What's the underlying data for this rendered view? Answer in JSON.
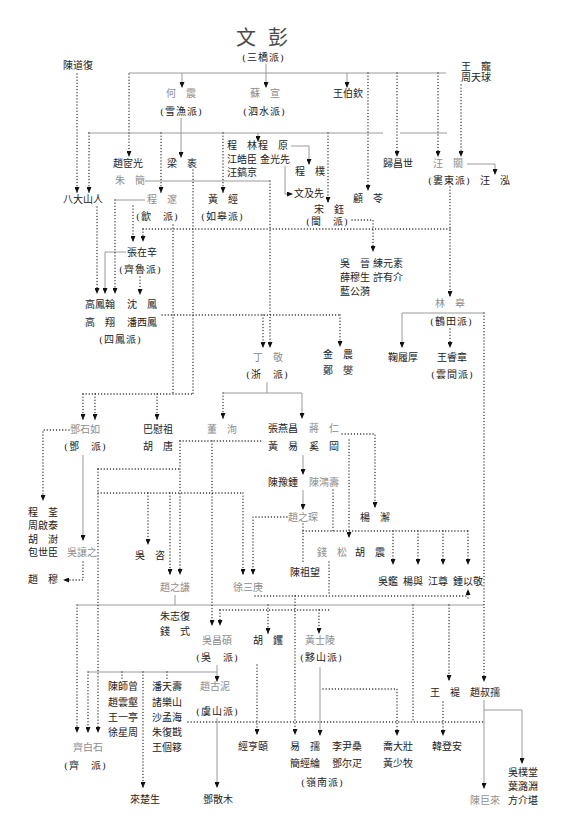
{
  "root": {
    "name": "文 彭",
    "school": "(三橋派)"
  },
  "people": {
    "chen_daofu": "陳道復",
    "wang_chong": "王 寵",
    "zhou_tianqiu": "周天球",
    "he_zhen": "何 震",
    "su_xuan": "蘇 宣",
    "wang_boqin": "王伯欽",
    "zhao_yiguang": "趙宧光",
    "liang_zhi": "梁 袠",
    "cheng_lin": "程 林",
    "cheng_yuan": "程 原",
    "jiang_haochen": "江皓臣",
    "jin_guangxian": "金光先",
    "wang_gaojing": "汪鎬京",
    "cheng_pu": "程 樸",
    "gui_changshi": "歸昌世",
    "wang_guan": "汪 關",
    "wang_hong": "汪 泓",
    "zhu_jian": "朱 簡",
    "badashanren": "八大山人",
    "cheng_sui": "程 邃",
    "huang_jing": "黃 經",
    "wen_jixian": "文及先",
    "gu_ling": "顧 苓",
    "song_jue": "宋 鈺",
    "zhang_zaixin": "張在辛",
    "wu_jin": "吳 晉",
    "lian_yuansu": "練元素",
    "xue_musheng": "薛穆生",
    "xu_youjie": "許有介",
    "lan_gongyi": "藍公漪",
    "lin_gao": "林 皋",
    "gao_fenghan": "高鳳翰",
    "shen_feng": "沈 鳳",
    "gao_xiang": "高 翔",
    "pan_xifeng": "潘西鳳",
    "ding_jing": "丁 敬",
    "jin_nong": "金 農",
    "zheng_xie": "鄭 燮",
    "ju_lvhou": "鞠履厚",
    "wang_ruizhang": "王睿章",
    "deng_shiru": "鄧石如",
    "ba_weizu": "巴慰祖",
    "hu_tang": "胡 唐",
    "dong_xun": "董 洵",
    "zhang_yanchang": "張燕昌",
    "jiang_ren": "蔣 仁",
    "huang_yi": "黃 易",
    "xi_gang": "奚 岡",
    "chen_yuzhong": "陳豫鍾",
    "chen_hongshou": "陳鴻壽",
    "zhao_zhichen": "趙之琛",
    "yang_xie": "楊 澥",
    "cheng_quan": "程 荃",
    "zhou_qitai": "周啟泰",
    "hu_shu": "胡 澍",
    "bao_shichen": "包世臣",
    "wu_rangzhi": "吳讓之",
    "zhao_mu": "趙 穆",
    "wu_zi": "吳 咨",
    "zhao_zhiqian": "趙之謙",
    "xu_sangeng": "徐三庚",
    "qian_song": "錢 松",
    "hu_zhen": "胡 震",
    "chen_zuwang": "陳祖望",
    "wu_jian": "吳鑑",
    "yang_yu": "楊與",
    "jiang_zun": "江尊",
    "zhong_yijing": "鍾以敬",
    "zhu_zhifu": "朱志復",
    "qian_shi": "錢 式",
    "wu_changshuo": "吳昌碩",
    "hu_jue": "胡 钁",
    "huang_shiling": "黃士陵",
    "wang_ti": "王 褆",
    "zhao_shuru": "趙叔孺",
    "chen_shizeng": "陳師曾",
    "zhao_yunhe": "趙雲壑",
    "wang_yiting": "王一亭",
    "xu_xingzhou": "徐星周",
    "pan_tianshou": "潘天壽",
    "zhu_leshan": "諸樂山",
    "sha_menghai": "沙孟海",
    "zhu_fukan": "朱復戡",
    "wang_geyi": "王個簃",
    "zhao_guni": "趙古泥",
    "qi_baishi": "齊白石",
    "jing_hengyi": "經亨頤",
    "yi_ru": "易 孺",
    "li_yinsang": "李尹桑",
    "jian_jinglun": "簡經綸",
    "deng_erya": "鄧尔疋",
    "qiao_dazhuang": "喬大壯",
    "huang_shaomu": "黃少牧",
    "han_dengan": "韓登安",
    "wu_putang": "吳樸堂",
    "ye_luyuan": "葉潞淵",
    "fang_jiekan": "方介堪",
    "chen_julai": "陳巨來",
    "lai_chusheng": "來楚生",
    "deng_sanmu": "鄧散木"
  },
  "schools": {
    "xueyu": "(雪漁派)",
    "sishui": "(泗水派)",
    "loudong": "(婁東派)",
    "she": "(歙 派)",
    "rugao": "(如皋派)",
    "min": "(閩 派)",
    "qilu": "(齊魯派)",
    "hetian": "(鶴田派)",
    "sifeng": "(四鳳派)",
    "zhe": "(浙 派)",
    "yunjian": "(雲間派)",
    "deng": "(鄧 派)",
    "wu": "(吳 派)",
    "yishan": "(黟山派)",
    "yushan": "(虞山派)",
    "qi": "(齊 派)",
    "lingnan": "(嶺南派)"
  },
  "colors": {
    "text": "#222222",
    "master_text": "#8d8d8d",
    "solid_line": "#9a9a9a",
    "dotted_line": "#222222",
    "background": "#ffffff"
  },
  "legend_styles": {
    "solid": "direct lineage (solid gray line with arrow)",
    "dotted": "influence (dotted line with arrow)"
  },
  "edges": [
    {
      "from": "root",
      "to": "he_zhen",
      "style": "solid"
    },
    {
      "from": "root",
      "to": "su_xuan",
      "style": "solid"
    },
    {
      "from": "root",
      "to": "wang_boqin",
      "style": "solid"
    },
    {
      "from": "root",
      "to": "zhao_yiguang",
      "style": "dotted"
    },
    {
      "from": "root",
      "to": "gu_ling",
      "style": "dotted"
    },
    {
      "from": "root",
      "to": "gui_changshi",
      "style": "dotted"
    },
    {
      "from": "root",
      "to": "wang_guan",
      "style": "dotted"
    },
    {
      "from": "zhou_tianqiu",
      "to": "wang_guan",
      "style": "dotted"
    },
    {
      "from": "chen_daofu",
      "to": "badashanren",
      "style": "dotted"
    },
    {
      "from": "he_zhen",
      "to": "liang_zhi",
      "style": "solid"
    },
    {
      "from": "su_xuan",
      "to": "cheng_lin",
      "style": "solid"
    },
    {
      "from": "cheng_yuan",
      "to": "cheng_pu",
      "style": "solid"
    },
    {
      "from": "jin_guangxian",
      "to": "wen_jixian",
      "style": "solid"
    },
    {
      "from": "wang_guan",
      "to": "wang_hong",
      "style": "solid"
    },
    {
      "from": "wang_guan",
      "to": "lin_gao",
      "style": "dotted"
    },
    {
      "from": "zhu_jian",
      "to": "ding_jing",
      "style": "dotted"
    },
    {
      "from": "cheng_sui",
      "to": "gao_fenghan",
      "style": "dotted"
    },
    {
      "from": "badashanren",
      "to": "gao_fenghan",
      "style": "dotted"
    },
    {
      "from": "zhang_zaixin",
      "to": "gao_fenghan",
      "style": "solid"
    },
    {
      "from": "zhang_zaixin",
      "to": "shen_feng",
      "style": "dotted"
    },
    {
      "from": "song_jue",
      "to": "wu_jin",
      "style": "dotted"
    },
    {
      "from": "lin_gao",
      "to": "ju_lvhou",
      "style": "solid"
    },
    {
      "from": "lin_gao",
      "to": "wang_ruizhang",
      "style": "dotted"
    },
    {
      "from": "lin_gao",
      "to": "zhao_shuru",
      "style": "dotted"
    },
    {
      "from": "gao_fenghan",
      "to": "ding_jing",
      "style": "dotted"
    },
    {
      "from": "gao_fenghan",
      "to": "jin_nong",
      "style": "dotted"
    },
    {
      "from": "liang_zhi",
      "to": "deng_shiru",
      "style": "dotted"
    },
    {
      "from": "liang_zhi",
      "to": "ba_weizu",
      "style": "dotted"
    },
    {
      "from": "ding_jing",
      "to": "dong_xun",
      "style": "dotted"
    },
    {
      "from": "ding_jing",
      "to": "zhang_yanchang",
      "style": "solid"
    },
    {
      "from": "huang_yi",
      "to": "chen_yuzhong",
      "style": "solid"
    },
    {
      "from": "chen_yuzhong",
      "to": "zhao_zhichen",
      "style": "solid"
    },
    {
      "from": "jiang_ren",
      "to": "yang_xie",
      "style": "dotted"
    },
    {
      "from": "deng_shiru",
      "to": "cheng_quan",
      "style": "dotted"
    },
    {
      "from": "deng_shiru",
      "to": "wu_rangzhi",
      "style": "solid"
    },
    {
      "from": "wu_rangzhi",
      "to": "zhao_mu",
      "style": "dotted"
    },
    {
      "from": "zhao_zhichen",
      "to": "xu_sangeng",
      "style": "dotted"
    },
    {
      "from": "zhao_zhiqian",
      "to": "zhu_zhifu",
      "style": "solid"
    },
    {
      "from": "wu_changshuo",
      "to": "zhao_guni",
      "style": "solid"
    },
    {
      "from": "wu_changshuo",
      "to": "qi_baishi",
      "style": "dotted"
    },
    {
      "from": "wu_changshuo",
      "to": "lai_chusheng",
      "style": "dotted"
    },
    {
      "from": "zhao_guni",
      "to": "deng_sanmu",
      "style": "solid"
    },
    {
      "from": "huang_shiling",
      "to": "yi_ru",
      "style": "solid"
    },
    {
      "from": "huang_shiling",
      "to": "qiao_dazhuang",
      "style": "dotted"
    },
    {
      "from": "wang_ti",
      "to": "han_dengan",
      "style": "dotted"
    },
    {
      "from": "zhao_shuru",
      "to": "chen_julai",
      "style": "solid"
    },
    {
      "from": "zhao_shuru",
      "to": "wu_putang",
      "style": "solid"
    }
  ]
}
